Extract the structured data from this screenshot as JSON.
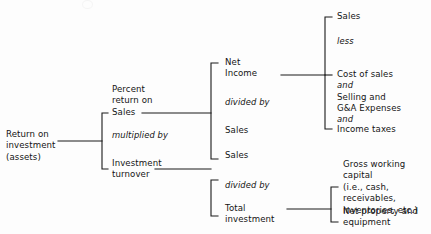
{
  "diagram": {
    "type": "tree-diagram",
    "line_color": "#1a1a1a",
    "text_color": "#141414",
    "background": "#fdfdfd",
    "root": {
      "label": "Return on\ninvestment\n(assets)"
    },
    "level2": {
      "branch_a": "Percent\nreturn on\nSales",
      "operator": "multiplied by",
      "branch_b": "Investment\nturnover"
    },
    "level3_top": {
      "numerator": "Net\nIncome",
      "operator": "divided by",
      "denominator": "Sales"
    },
    "level3_bottom": {
      "numerator": "Sales",
      "operator": "divided by",
      "denominator": "Total\ninvestment"
    },
    "level4_top": {
      "item1": "Sales",
      "op1": "less",
      "item2": "Cost of sales",
      "op2": "and",
      "item3": "Selling and\nG&A Expenses",
      "op3": "and",
      "item4": "Income taxes"
    },
    "level4_bottom": {
      "item1": "Gross working capital\n(i.e., cash, receivables,\ninventories, etc.)",
      "item2": "Net property and\nequipment"
    }
  }
}
